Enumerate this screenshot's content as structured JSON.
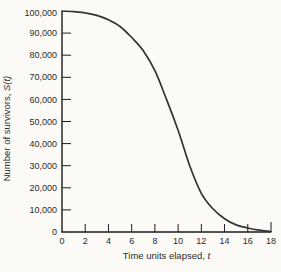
{
  "figure": {
    "background": "#fbfaf7",
    "ink_color": "#2b2b2b",
    "axis_color": "#1c1c1c",
    "curve_color": "#333333"
  },
  "chart_data": {
    "type": "line",
    "title": "",
    "xlabel": {
      "text": "Time units elapsed, ",
      "var": "t"
    },
    "ylabel": {
      "text": "Number of survivors, ",
      "var": "S(t)"
    },
    "xlim": [
      0,
      18
    ],
    "ylim": [
      0,
      100000
    ],
    "grid": false,
    "legend": "none",
    "x_ticks": [
      0,
      2,
      4,
      6,
      8,
      10,
      12,
      14,
      16,
      18
    ],
    "x_tick_labels": [
      "0",
      "2",
      "4",
      "6",
      "8",
      "10",
      "12",
      "14",
      "16",
      "18"
    ],
    "y_ticks": [
      0,
      10000,
      20000,
      30000,
      40000,
      50000,
      60000,
      70000,
      80000,
      90000,
      100000
    ],
    "y_tick_labels": [
      "0",
      "10,000",
      "20,000",
      "30,000",
      "40,000",
      "50,000",
      "60,000",
      "70,000",
      "80,000",
      "90,000",
      "100,000"
    ],
    "series": [
      {
        "name": "S(t)",
        "x": [
          0,
          1,
          2,
          3,
          4,
          5,
          6,
          7,
          8,
          9,
          10,
          11,
          12,
          13,
          14,
          15,
          16,
          17,
          18
        ],
        "values": [
          100000,
          99700,
          99200,
          98000,
          96000,
          93000,
          88000,
          82000,
          73000,
          60000,
          46000,
          30000,
          17500,
          10500,
          6000,
          3200,
          1800,
          800,
          200
        ]
      }
    ]
  }
}
